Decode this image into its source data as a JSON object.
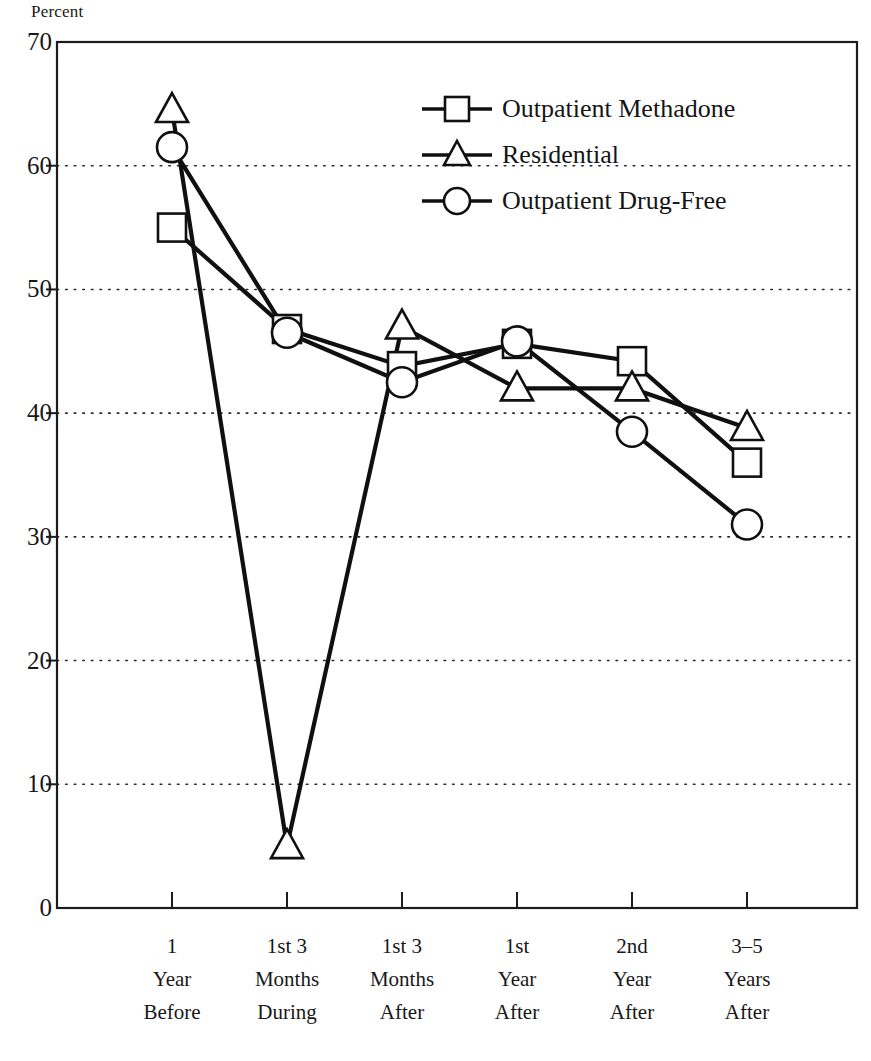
{
  "chart_data": {
    "type": "line",
    "title": "",
    "ylabel": "Percent",
    "xlabel": "",
    "ylim": [
      0,
      70
    ],
    "yticks": [
      0,
      10,
      20,
      30,
      40,
      50,
      60,
      70
    ],
    "grid": true,
    "legend_position": "upper-right-inside",
    "categories": [
      "1 Year Before",
      "1st 3 Months During",
      "1st 3 Months After",
      "1st Year After",
      "2nd Year After",
      "3-5 Years After"
    ],
    "category_lines": [
      [
        "1",
        "Year",
        "Before"
      ],
      [
        "1st 3",
        "Months",
        "During"
      ],
      [
        "1st 3",
        "Months",
        "After"
      ],
      [
        "1st",
        "Year",
        "After"
      ],
      [
        "2nd",
        "Year",
        "After"
      ],
      [
        "3–5",
        "Years",
        "After"
      ]
    ],
    "series": [
      {
        "name": "Outpatient Methadone",
        "marker": "square",
        "values": [
          55.0,
          46.8,
          43.8,
          45.6,
          44.2,
          36.0
        ]
      },
      {
        "name": "Residential",
        "marker": "triangle",
        "values": [
          64.5,
          5.0,
          47.0,
          42.0,
          42.0,
          38.8
        ]
      },
      {
        "name": "Outpatient Drug-Free",
        "marker": "circle",
        "values": [
          61.5,
          46.5,
          42.5,
          45.8,
          38.5,
          31.0
        ]
      }
    ]
  },
  "axis": {
    "y_title": "Percent",
    "y_tick_labels": [
      "70",
      "60",
      "50",
      "40",
      "30",
      "20",
      "10",
      "0"
    ]
  },
  "legend": {
    "items": [
      {
        "label": "Outpatient Methadone",
        "marker": "square"
      },
      {
        "label": "Residential",
        "marker": "triangle"
      },
      {
        "label": "Outpatient Drug-Free",
        "marker": "circle"
      }
    ]
  },
  "colors": {
    "ink": "#101010",
    "frame": "#1c1c1c",
    "grid": "#2a2a2a",
    "marker_fill": "#ffffff",
    "background": "#ffffff"
  }
}
